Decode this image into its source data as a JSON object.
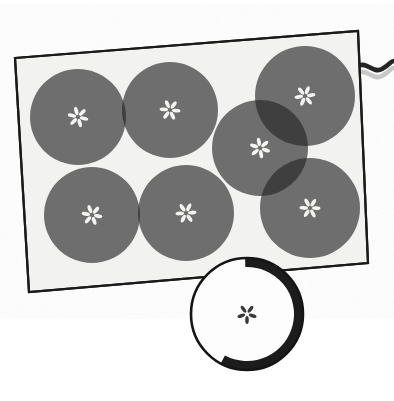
{
  "scene": {
    "title": "Apple slices arranged on a tray",
    "width": 394,
    "height": 401,
    "background": "#ffffff"
  },
  "palette": {
    "page_background": "#ffffff",
    "tray_fill": "#f2f2f0",
    "tray_border": "#1a1a1a",
    "slice_gray": "#6e6e6e",
    "slice_overlap_dark": "#3f3f3f",
    "slice_seed_light": "#f4f4f2",
    "front_slice_fill": "#fdfdfd",
    "front_slice_outline": "#151515",
    "front_slice_shadow": "#1c1c1c",
    "front_seed_dark": "#3a3a3a",
    "cord_dark": "#1d1d1d",
    "cord_light": "#c9c9c9"
  },
  "tray": {
    "name": "cutting-board",
    "rotation_deg": -4.2,
    "corners": [
      {
        "x": 15,
        "y": 58
      },
      {
        "x": 358,
        "y": 31
      },
      {
        "x": 368,
        "y": 263
      },
      {
        "x": 29,
        "y": 292
      }
    ],
    "border_width": 2.2
  },
  "slices": [
    {
      "id": "slice-1",
      "label": "apple-slice-top-left",
      "cx": 78,
      "cy": 117,
      "r": 48,
      "seed_petals": 6,
      "seed_rotation": 14
    },
    {
      "id": "slice-2",
      "label": "apple-slice-top-center",
      "cx": 170,
      "cy": 110,
      "r": 48,
      "seed_petals": 6,
      "seed_rotation": 6
    },
    {
      "id": "slice-3",
      "label": "apple-slice-top-right",
      "cx": 305,
      "cy": 96,
      "r": 50,
      "seed_petals": 6,
      "seed_rotation": -8
    },
    {
      "id": "slice-4",
      "label": "apple-slice-middle-right",
      "cx": 260,
      "cy": 148,
      "r": 48,
      "seed_petals": 6,
      "seed_rotation": 20
    },
    {
      "id": "slice-5",
      "label": "apple-slice-bottom-left",
      "cx": 92,
      "cy": 215,
      "r": 48,
      "seed_petals": 6,
      "seed_rotation": 10
    },
    {
      "id": "slice-6",
      "label": "apple-slice-bottom-center",
      "cx": 186,
      "cy": 213,
      "r": 48,
      "seed_petals": 6,
      "seed_rotation": -4
    },
    {
      "id": "slice-7",
      "label": "apple-slice-bottom-right",
      "cx": 310,
      "cy": 208,
      "r": 50,
      "seed_petals": 6,
      "seed_rotation": 2
    }
  ],
  "front_slice": {
    "name": "foreground-apple-slice",
    "cx": 247,
    "cy": 314,
    "r": 56,
    "outline_width": 2.6,
    "shadow_arc_width": 9,
    "seed_petals": 5,
    "seed_rotation": 18
  },
  "cord": {
    "name": "power-cord",
    "visible": true,
    "start_x": 358,
    "start_y": 66,
    "end_x": 394,
    "end_y": 62,
    "stroke_width": 4.5
  },
  "labels": {
    "scene_caption": ""
  }
}
